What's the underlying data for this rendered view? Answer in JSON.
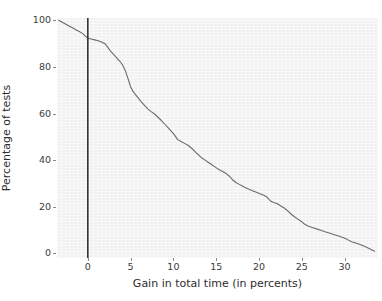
{
  "chart_data": {
    "type": "line",
    "title": "",
    "subtitle": "",
    "xlabel": "Gain in total time (in percents)",
    "ylabel": "Percentage of tests",
    "xlim": [
      -3.6,
      33.9
    ],
    "ylim": [
      -2,
      101
    ],
    "grid": false,
    "legend": null,
    "legend_position": "none",
    "xticks": [
      0,
      5,
      10,
      15,
      20,
      25,
      30
    ],
    "xticklabels": [
      "0",
      "5",
      "10",
      "15",
      "20",
      "25",
      "30"
    ],
    "yticks": [
      0,
      20,
      40,
      60,
      80,
      100
    ],
    "yticklabels": [
      "0",
      "20",
      "40",
      "60",
      "80",
      "100"
    ],
    "series": [
      {
        "name": "cumulative-percentage-of-tests",
        "color": "#6b6b6b",
        "linewidth": 1.1,
        "x": [
          -3.4,
          -3.0,
          -2.6,
          -2.2,
          -1.8,
          -1.4,
          -1.0,
          -0.6,
          -0.2,
          0.0,
          0.4,
          0.8,
          1.2,
          1.6,
          2.0,
          2.3,
          2.6,
          2.9,
          3.2,
          3.5,
          3.8,
          4.1,
          4.4,
          4.7,
          5.0,
          5.3,
          5.6,
          5.9,
          6.2,
          6.6,
          7.0,
          7.4,
          7.8,
          8.2,
          8.6,
          9.0,
          9.4,
          9.8,
          10.2,
          10.5,
          10.9,
          11.3,
          11.7,
          12.1,
          12.5,
          12.9,
          13.3,
          13.7,
          14.1,
          14.5,
          14.9,
          15.3,
          15.7,
          16.1,
          16.5,
          16.9,
          17.3,
          17.7,
          18.1,
          18.5,
          18.9,
          19.3,
          19.7,
          20.1,
          20.5,
          20.9,
          21.3,
          21.7,
          22.1,
          22.5,
          22.9,
          23.3,
          23.7,
          24.1,
          24.5,
          24.9,
          25.3,
          25.8,
          26.3,
          26.8,
          27.3,
          27.8,
          28.3,
          28.8,
          29.3,
          29.8,
          30.3,
          30.8,
          31.3,
          31.8,
          32.3,
          32.8,
          33.2,
          33.5
        ],
        "y": [
          100.0,
          99.2,
          98.4,
          97.6,
          96.8,
          96.0,
          95.2,
          94.3,
          93.0,
          92.3,
          92.0,
          91.6,
          91.2,
          90.7,
          90.0,
          88.6,
          87.0,
          85.8,
          84.6,
          83.4,
          82.2,
          80.6,
          78.2,
          75.0,
          71.4,
          69.4,
          68.0,
          66.6,
          65.2,
          63.6,
          62.0,
          60.8,
          59.8,
          58.4,
          57.0,
          55.4,
          53.8,
          52.2,
          50.4,
          48.8,
          48.0,
          47.2,
          46.4,
          45.2,
          43.8,
          42.4,
          41.0,
          40.0,
          39.0,
          38.0,
          37.0,
          36.0,
          35.2,
          34.4,
          33.2,
          31.6,
          30.4,
          29.6,
          28.8,
          28.0,
          27.4,
          26.8,
          26.2,
          25.6,
          25.0,
          24.2,
          22.6,
          21.8,
          21.4,
          20.4,
          19.6,
          18.4,
          17.0,
          15.8,
          14.8,
          13.8,
          12.6,
          11.6,
          11.0,
          10.4,
          9.8,
          9.2,
          8.6,
          8.0,
          7.4,
          6.8,
          6.0,
          5.0,
          4.4,
          3.8,
          3.0,
          2.2,
          1.4,
          0.9
        ]
      }
    ],
    "annotations": [
      {
        "type": "vertical-reference-line",
        "name": "zero-gain-reference-line",
        "x": 0,
        "color": "#333333",
        "linewidth": 1.6,
        "label": ""
      }
    ]
  }
}
